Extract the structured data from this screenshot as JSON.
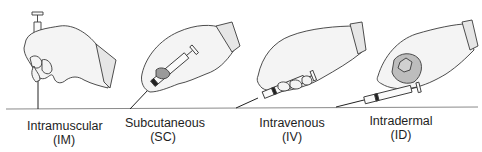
{
  "figure": {
    "skin_line_color": "#8a8a8a",
    "glove_fill": "#f4f4f4",
    "glove_stroke": "#3a3a3a",
    "cuff_fill": "#e6e6e6",
    "knuckle_fill": "#bdbdbd"
  },
  "routes": [
    {
      "name": "Intramuscular",
      "abbr": "(IM)",
      "angle_deg": 90
    },
    {
      "name": "Subcutaneous",
      "abbr": "(SC)",
      "angle_deg": 45
    },
    {
      "name": "Intravenous",
      "abbr": "(IV)",
      "angle_deg": 25
    },
    {
      "name": "Intradermal",
      "abbr": "(ID)",
      "angle_deg": 15
    }
  ]
}
